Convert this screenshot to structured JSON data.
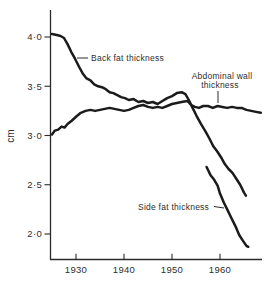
{
  "figure": {
    "background": "#ffffff",
    "line_color": "#1b1b1b",
    "text_color": "#2e2e2e"
  },
  "axes": {
    "ylabel": "cm",
    "y_ticks": [
      {
        "label": "4·0",
        "value": 4.0
      },
      {
        "label": "3·5",
        "value": 3.5
      },
      {
        "label": "3·0",
        "value": 3.0
      },
      {
        "label": "2·5",
        "value": 2.5
      },
      {
        "label": "2·0",
        "value": 2.0
      }
    ],
    "x_ticks": [
      {
        "label": "1930",
        "value": 1930
      },
      {
        "label": "1940",
        "value": 1940
      },
      {
        "label": "1950",
        "value": 1950
      },
      {
        "label": "1960",
        "value": 1960
      }
    ]
  },
  "annotations": {
    "back_fat": "Back fat thickness",
    "abdominal_line1": "Abdominal wall",
    "abdominal_line2": "thickness",
    "side_fat": "Side fat thickness"
  },
  "chart_data": {
    "type": "line",
    "title": "",
    "xlabel": "",
    "ylabel": "cm",
    "xlim": [
      1924.6,
      1968.8
    ],
    "ylim": [
      1.73,
      4.27
    ],
    "x_axis_ticks": [
      1930,
      1940,
      1950,
      1960
    ],
    "y_axis_ticks": [
      2.0,
      2.5,
      3.0,
      3.5,
      4.0
    ],
    "grid": false,
    "legend": "inline-labels",
    "series": [
      {
        "name": "Back fat thickness",
        "points": [
          [
            1925.0,
            4.03
          ],
          [
            1926.0,
            4.02
          ],
          [
            1926.8,
            4.01
          ],
          [
            1927.5,
            3.99
          ],
          [
            1928.2,
            3.93
          ],
          [
            1929.0,
            3.85
          ],
          [
            1929.8,
            3.78
          ],
          [
            1930.6,
            3.7
          ],
          [
            1931.4,
            3.63
          ],
          [
            1932.2,
            3.58
          ],
          [
            1933.0,
            3.56
          ],
          [
            1933.8,
            3.52
          ],
          [
            1934.6,
            3.5
          ],
          [
            1935.4,
            3.49
          ],
          [
            1936.2,
            3.47
          ],
          [
            1937.0,
            3.44
          ],
          [
            1937.8,
            3.43
          ],
          [
            1938.6,
            3.41
          ],
          [
            1939.4,
            3.39
          ],
          [
            1940.2,
            3.38
          ],
          [
            1941.0,
            3.36
          ],
          [
            1942.0,
            3.37
          ],
          [
            1943.0,
            3.34
          ],
          [
            1944.0,
            3.35
          ],
          [
            1945.0,
            3.33
          ],
          [
            1946.0,
            3.34
          ],
          [
            1947.0,
            3.32
          ],
          [
            1948.0,
            3.35
          ],
          [
            1949.0,
            3.38
          ],
          [
            1950.0,
            3.4
          ],
          [
            1951.0,
            3.43
          ],
          [
            1952.0,
            3.44
          ],
          [
            1952.8,
            3.42
          ],
          [
            1953.5,
            3.36
          ],
          [
            1954.3,
            3.28
          ],
          [
            1955.1,
            3.2
          ],
          [
            1956.0,
            3.12
          ],
          [
            1957.0,
            3.04
          ],
          [
            1957.8,
            2.97
          ],
          [
            1958.6,
            2.89
          ],
          [
            1959.4,
            2.84
          ],
          [
            1960.2,
            2.78
          ],
          [
            1961.0,
            2.71
          ],
          [
            1961.8,
            2.66
          ],
          [
            1962.6,
            2.62
          ],
          [
            1963.4,
            2.56
          ],
          [
            1964.2,
            2.5
          ],
          [
            1965.0,
            2.42
          ],
          [
            1965.4,
            2.39
          ]
        ]
      },
      {
        "name": "Abdominal wall thickness",
        "points": [
          [
            1925.0,
            3.01
          ],
          [
            1925.6,
            3.05
          ],
          [
            1926.3,
            3.06
          ],
          [
            1927.0,
            3.09
          ],
          [
            1927.6,
            3.08
          ],
          [
            1928.3,
            3.12
          ],
          [
            1929.1,
            3.15
          ],
          [
            1930.0,
            3.19
          ],
          [
            1931.0,
            3.23
          ],
          [
            1932.0,
            3.25
          ],
          [
            1933.0,
            3.26
          ],
          [
            1934.0,
            3.25
          ],
          [
            1935.0,
            3.26
          ],
          [
            1936.0,
            3.27
          ],
          [
            1937.0,
            3.28
          ],
          [
            1938.0,
            3.27
          ],
          [
            1939.0,
            3.26
          ],
          [
            1940.0,
            3.25
          ],
          [
            1941.0,
            3.26
          ],
          [
            1942.0,
            3.28
          ],
          [
            1943.0,
            3.3
          ],
          [
            1944.0,
            3.31
          ],
          [
            1945.0,
            3.29
          ],
          [
            1946.0,
            3.28
          ],
          [
            1947.0,
            3.29
          ],
          [
            1948.0,
            3.28
          ],
          [
            1949.0,
            3.3
          ],
          [
            1950.0,
            3.32
          ],
          [
            1951.0,
            3.33
          ],
          [
            1952.0,
            3.34
          ],
          [
            1953.2,
            3.35
          ],
          [
            1954.0,
            3.31
          ],
          [
            1954.8,
            3.29
          ],
          [
            1955.6,
            3.28
          ],
          [
            1956.5,
            3.3
          ],
          [
            1957.5,
            3.3
          ],
          [
            1958.5,
            3.28
          ],
          [
            1959.5,
            3.3
          ],
          [
            1960.5,
            3.29
          ],
          [
            1961.5,
            3.28
          ],
          [
            1962.5,
            3.29
          ],
          [
            1963.5,
            3.28
          ],
          [
            1964.5,
            3.28
          ],
          [
            1965.5,
            3.26
          ],
          [
            1966.5,
            3.25
          ],
          [
            1967.5,
            3.24
          ],
          [
            1968.5,
            3.23
          ]
        ]
      },
      {
        "name": "Side fat thickness",
        "points": [
          [
            1957.2,
            2.68
          ],
          [
            1958.0,
            2.6
          ],
          [
            1958.8,
            2.55
          ],
          [
            1959.5,
            2.49
          ],
          [
            1960.0,
            2.41
          ],
          [
            1960.8,
            2.32
          ],
          [
            1961.5,
            2.25
          ],
          [
            1962.3,
            2.17
          ],
          [
            1963.2,
            2.08
          ],
          [
            1964.0,
            1.99
          ],
          [
            1964.8,
            1.93
          ],
          [
            1965.5,
            1.88
          ],
          [
            1965.9,
            1.87
          ]
        ]
      }
    ]
  }
}
